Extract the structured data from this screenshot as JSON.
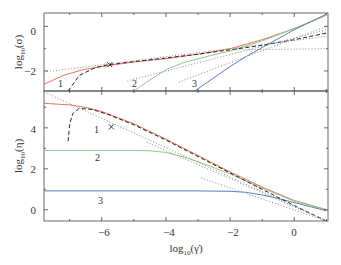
{
  "chart_data": [
    {
      "type": "line",
      "panel": "top",
      "title": "",
      "xlabel": "log10(γ̇)",
      "ylabel": "log10(σ)",
      "xlim": [
        -7.8,
        1.05
      ],
      "ylim": [
        -2.9,
        0.6
      ],
      "yticks": [
        0,
        -2
      ],
      "xticks": [
        -6,
        -4,
        -2,
        0
      ],
      "grid": false,
      "legend": "none",
      "curve_labels": [
        "1",
        "2",
        "3"
      ],
      "series": [
        {
          "name": "1",
          "color": "#e8735a",
          "style": "solid",
          "x": [
            -7.8,
            -7.2,
            -6.6,
            -6.0,
            -5.0,
            -4.0,
            -3.0,
            -2.0,
            -1.0,
            0.0,
            1.0
          ],
          "y": [
            -2.6,
            -2.2,
            -1.95,
            -1.8,
            -1.6,
            -1.45,
            -1.25,
            -1.0,
            -0.6,
            -0.1,
            0.5
          ]
        },
        {
          "name": "2",
          "color": "#8fc98a",
          "style": "solid",
          "x": [
            -5.0,
            -4.6,
            -4.0,
            -3.5,
            -3.0,
            -2.0,
            -1.0,
            0.0,
            1.0
          ],
          "y": [
            -2.9,
            -2.5,
            -1.95,
            -1.65,
            -1.45,
            -1.1,
            -0.65,
            -0.1,
            0.5
          ]
        },
        {
          "name": "3",
          "color": "#5a7fbf",
          "style": "solid",
          "x": [
            -3.1,
            -2.5,
            -2.0,
            -1.5,
            -1.0,
            -0.5,
            0.0,
            0.5,
            1.0
          ],
          "y": [
            -2.9,
            -2.3,
            -1.8,
            -1.35,
            -0.95,
            -0.55,
            -0.15,
            0.2,
            0.55
          ]
        },
        {
          "name": "limit",
          "color": "#222222",
          "style": "dashed",
          "x": [
            -7.05,
            -6.7,
            -6.2,
            -5.8,
            -5.0,
            -4.0,
            -3.0,
            -2.0,
            -1.0,
            0.0,
            1.0
          ],
          "y": [
            -2.9,
            -2.2,
            -1.85,
            -1.72,
            -1.58,
            -1.42,
            -1.25,
            -1.05,
            -0.85,
            -0.6,
            -0.3
          ]
        },
        {
          "name": "asymptote-1",
          "color": "#888888",
          "style": "dotted",
          "x": [
            -7.8,
            1.0
          ],
          "y": [
            -2.05,
            -0.45
          ]
        },
        {
          "name": "asymptote-2",
          "color": "#888888",
          "style": "dotted",
          "x": [
            -5.2,
            1.0
          ],
          "y": [
            -2.45,
            -0.15
          ]
        },
        {
          "name": "asymptote-3",
          "color": "#888888",
          "style": "dotted",
          "x": [
            -3.6,
            1.0
          ],
          "y": [
            -2.5,
            0.0
          ]
        },
        {
          "name": "asymptote-4",
          "color": "#888888",
          "style": "dotted",
          "x": [
            -1.8,
            1.0
          ],
          "y": [
            -1.05,
            -1.0
          ]
        }
      ],
      "markers": [
        {
          "symbol": "x",
          "x": -5.75,
          "y": -1.72
        }
      ]
    },
    {
      "type": "line",
      "panel": "bottom",
      "title": "",
      "xlabel": "log10(γ̇)",
      "ylabel": "log10(η)",
      "xlim": [
        -7.8,
        1.05
      ],
      "ylim": [
        -0.55,
        5.8
      ],
      "yticks": [
        0,
        2,
        4
      ],
      "xticks": [
        -6,
        -4,
        -2,
        0
      ],
      "grid": false,
      "legend": "none",
      "curve_labels": [
        "1",
        "2",
        "3"
      ],
      "series": [
        {
          "name": "1",
          "color": "#e8735a",
          "style": "solid",
          "x": [
            -7.8,
            -7.0,
            -6.5,
            -6.0,
            -5.0,
            -4.0,
            -3.0,
            -2.0,
            -1.0,
            0.0,
            1.0
          ],
          "y": [
            5.2,
            5.12,
            5.0,
            4.8,
            4.2,
            3.45,
            2.65,
            1.85,
            1.1,
            0.45,
            0.0
          ]
        },
        {
          "name": "2",
          "color": "#8fc98a",
          "style": "solid",
          "x": [
            -7.8,
            -5.0,
            -4.5,
            -4.0,
            -3.5,
            -3.0,
            -2.0,
            -1.0,
            0.0,
            1.0
          ],
          "y": [
            2.9,
            2.9,
            2.88,
            2.8,
            2.6,
            2.35,
            1.75,
            1.05,
            0.42,
            0.0
          ]
        },
        {
          "name": "3",
          "color": "#5a7fbf",
          "style": "solid",
          "x": [
            -7.8,
            -3.0,
            -2.5,
            -2.0,
            -1.5,
            -1.0,
            -0.5,
            0.0,
            0.5,
            1.0
          ],
          "y": [
            0.92,
            0.92,
            0.91,
            0.9,
            0.85,
            0.72,
            0.55,
            0.35,
            0.15,
            -0.05
          ]
        },
        {
          "name": "limit",
          "color": "#222222",
          "style": "dashed",
          "x": [
            -7.05,
            -7.0,
            -6.9,
            -6.7,
            -6.3,
            -5.8,
            -5.0,
            -4.0,
            -3.0,
            -2.0,
            -1.0,
            0.0,
            1.0
          ],
          "y": [
            3.35,
            4.2,
            4.7,
            4.95,
            4.9,
            4.65,
            4.15,
            3.4,
            2.6,
            1.8,
            1.0,
            0.2,
            -0.55
          ]
        },
        {
          "name": "asymptote-1",
          "color": "#888888",
          "style": "dotted",
          "x": [
            -7.8,
            1.0
          ],
          "y": [
            5.75,
            -0.55
          ]
        },
        {
          "name": "asymptote-2",
          "color": "#888888",
          "style": "dotted",
          "x": [
            -4.6,
            1.0
          ],
          "y": [
            3.3,
            -0.55
          ]
        },
        {
          "name": "asymptote-3",
          "color": "#888888",
          "style": "dotted",
          "x": [
            -2.9,
            1.0
          ],
          "y": [
            1.55,
            -0.55
          ]
        }
      ],
      "markers": [
        {
          "symbol": "x",
          "x": -5.7,
          "y": 4.05
        }
      ]
    }
  ],
  "axes": {
    "top": {
      "ylabel": "log",
      "ylabel_sub": "10",
      "ylabel_arg": "(σ)",
      "yticks": [
        "0",
        "−2"
      ]
    },
    "bottom": {
      "ylabel": "log",
      "ylabel_sub": "10",
      "ylabel_arg": "(η)",
      "yticks": [
        "4",
        "2",
        "0"
      ]
    },
    "x": {
      "label": "log",
      "label_sub": "10",
      "label_arg": "(γ̇)",
      "ticks": [
        "−6",
        "−4",
        "−2",
        "0"
      ]
    }
  },
  "curve_labels": {
    "top": [
      "1",
      "2",
      "3"
    ],
    "bottom": [
      "1",
      "2",
      "3"
    ]
  }
}
